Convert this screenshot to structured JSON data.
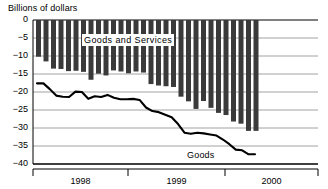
{
  "chart_data": {
    "type": "bar",
    "title": "",
    "ylabel": "Billions of dollars",
    "xlabel": "",
    "ylim": [
      -40,
      0
    ],
    "yticks": [
      0,
      -5,
      -10,
      -15,
      -20,
      -25,
      -30,
      -35,
      -40
    ],
    "ytick_labels": [
      "0",
      "−5",
      "−10",
      "−15",
      "−20",
      "−25",
      "−30",
      "−35",
      "−40"
    ],
    "grid": true,
    "legend_position": "inline-annotation",
    "xtick_labels": [
      "1998",
      "1999",
      "2000"
    ],
    "x_segments": [
      {
        "label": "1998",
        "start_px": 33,
        "end_px": 128
      },
      {
        "label": "1999",
        "start_px": 128,
        "end_px": 225
      },
      {
        "label": "2000",
        "start_px": 225,
        "end_px": 318
      }
    ],
    "series": [
      {
        "name": "Goods and Services",
        "type": "bar",
        "color": "#3a3a3a",
        "values": [
          -10.2,
          -11.5,
          -13.5,
          -13.6,
          -14.2,
          -14.1,
          -14.4,
          -16.6,
          -14.9,
          -15.4,
          -14.0,
          -14.3,
          -14.8,
          -14.3,
          -14.6,
          -17.8,
          -18.2,
          -18.4,
          -18.6,
          -21.3,
          -22.6,
          -24.7,
          -22.5,
          -24.4,
          -25.8,
          -26.4,
          -28.2,
          -28.8,
          -30.8,
          -30.8
        ]
      },
      {
        "name": "Goods",
        "type": "line",
        "color": "#000000",
        "values": [
          -17.6,
          -17.6,
          -19.2,
          -21.0,
          -21.3,
          -21.4,
          -19.9,
          -20.0,
          -21.9,
          -21.2,
          -21.4,
          -20.8,
          -21.6,
          -22.0,
          -22.0,
          -21.9,
          -22.2,
          -24.3,
          -25.3,
          -25.6,
          -26.3,
          -27.0,
          -28.9,
          -31.3,
          -31.6,
          -31.3,
          -31.5,
          -31.8,
          -32.1,
          -33.2,
          -34.5,
          -36.0,
          -36.2,
          -37.3,
          -37.3
        ]
      }
    ],
    "annotations": [
      {
        "name": "goods-and-services-label",
        "text": "Goods and Services"
      },
      {
        "name": "goods-label",
        "text": "Goods"
      }
    ]
  },
  "colors": {
    "bar": "#3a3a3a",
    "line": "#000000",
    "grid": "#8c8c8c",
    "axis": "#000000",
    "background": "#ffffff"
  }
}
